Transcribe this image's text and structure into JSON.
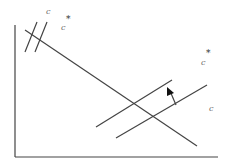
{
  "diagram": {
    "type": "economics shift diagram",
    "stroke_color": "#444444",
    "labels": {
      "top_c": "c",
      "top_c_star_base": "c",
      "top_star": "*",
      "right_c_star_base": "c",
      "right_star": "*",
      "right_c": "c"
    },
    "elements": {
      "y_axis": "vertical axis",
      "x_axis": "horizontal axis",
      "downward_line": "downward sloping line",
      "upper_upward_line": "shifted upward sloping line",
      "lower_upward_line": "original upward sloping line",
      "shift_arrow": "arrow indicating upward shift",
      "steep_lines": "two short parallel steep lines near origin"
    }
  }
}
